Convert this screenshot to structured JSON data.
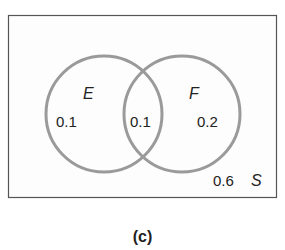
{
  "diagram": {
    "type": "venn",
    "universe": {
      "label": "S",
      "outside_probability": "0.6"
    },
    "sets": [
      {
        "label": "E",
        "only_probability": "0.1"
      },
      {
        "label": "F",
        "only_probability": "0.2"
      }
    ],
    "intersection_probability": "0.1",
    "caption": "(c)",
    "colors": {
      "circle_stroke": "#999999",
      "rect_stroke": "#555555",
      "text": "#222222"
    }
  }
}
